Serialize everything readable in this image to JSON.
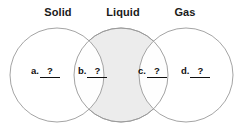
{
  "diagram": {
    "type": "venn-three-circle",
    "title_labels": [
      {
        "id": "solid",
        "text": "Solid"
      },
      {
        "id": "liquid",
        "text": "Liquid"
      },
      {
        "id": "gas",
        "text": "Gas"
      }
    ],
    "circles": [
      {
        "id": "solid-circle",
        "cx": 57,
        "cy": 75,
        "r": 47,
        "fill": "#ffffff",
        "stroke": "#9a9a9a"
      },
      {
        "id": "liquid-circle",
        "cx": 121,
        "cy": 75,
        "r": 47,
        "fill": "#ececec",
        "stroke": "#9a9a9a"
      },
      {
        "id": "gas-circle",
        "cx": 186,
        "cy": 75,
        "r": 47,
        "fill": "#ffffff",
        "stroke": "#9a9a9a"
      }
    ],
    "regions": [
      {
        "id": "a",
        "label": "a.",
        "value": "?",
        "description": "solid only"
      },
      {
        "id": "b",
        "label": "b.",
        "value": "?",
        "description": "solid and liquid overlap"
      },
      {
        "id": "c",
        "label": "c.",
        "value": "?",
        "description": "liquid and gas overlap"
      },
      {
        "id": "d",
        "label": "d.",
        "value": "?",
        "description": "gas only"
      }
    ],
    "colors": {
      "stroke": "#9a9a9a",
      "shaded_fill": "#ececec",
      "background": "#ffffff",
      "text": "#1a1a1a"
    }
  }
}
